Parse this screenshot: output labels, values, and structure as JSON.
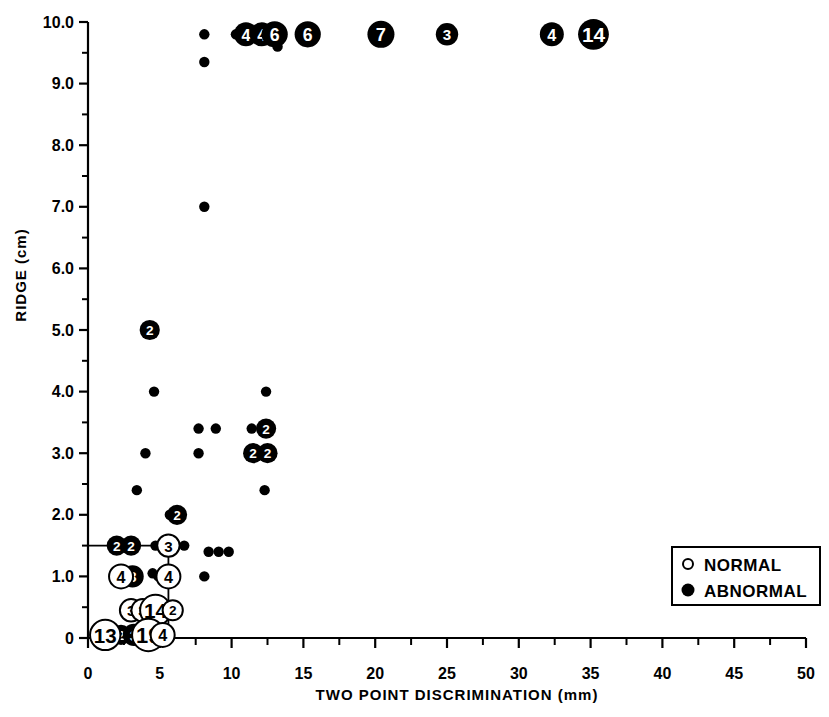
{
  "chart_data": {
    "type": "scatter",
    "title": "",
    "xlabel": "TWO POINT DISCRIMINATION  (mm)",
    "ylabel": "RIDGE (cm)",
    "xlim": [
      0,
      50
    ],
    "ylim": [
      0,
      10
    ],
    "xticks": [
      0,
      5,
      10,
      15,
      20,
      25,
      30,
      35,
      40,
      45,
      50
    ],
    "xtick_labels": [
      "0",
      "5",
      "10",
      "15",
      "20",
      "25",
      "30",
      "35",
      "40",
      "45",
      "50"
    ],
    "xtick_minor_step": 2.5,
    "yticks": [
      0,
      1,
      2,
      3,
      4,
      5,
      6,
      7,
      8,
      9,
      10
    ],
    "ytick_labels": [
      "0",
      "1.0",
      "2.0",
      "3.0",
      "4.0",
      "5.0",
      "6.0",
      "7.0",
      "8.0",
      "9.0",
      "10.0"
    ],
    "ytick_minor_step": 0.5,
    "grid": false,
    "legend_position": "bottom-right",
    "legend": [
      {
        "key": "normal",
        "label": "NORMAL",
        "marker": "open-circle"
      },
      {
        "key": "abnormal",
        "label": "ABNORMAL",
        "marker": "filled-circle"
      }
    ],
    "series": [
      {
        "name": "ABNORMAL",
        "marker": "filled-circle",
        "points": [
          {
            "x": 8.1,
            "y": 9.8,
            "n": 1
          },
          {
            "x": 8.1,
            "y": 9.35,
            "n": 1
          },
          {
            "x": 10.3,
            "y": 9.8,
            "n": 1
          },
          {
            "x": 11.0,
            "y": 9.8,
            "n": 4
          },
          {
            "x": 12.1,
            "y": 9.8,
            "n": 4
          },
          {
            "x": 13.0,
            "y": 9.8,
            "n": 6
          },
          {
            "x": 13.2,
            "y": 9.6,
            "n": 1
          },
          {
            "x": 15.3,
            "y": 9.8,
            "n": 6
          },
          {
            "x": 20.4,
            "y": 9.8,
            "n": 7
          },
          {
            "x": 25.0,
            "y": 9.8,
            "n": 3
          },
          {
            "x": 32.3,
            "y": 9.8,
            "n": 4
          },
          {
            "x": 35.2,
            "y": 9.8,
            "n": 14
          },
          {
            "x": 8.1,
            "y": 7.0,
            "n": 1
          },
          {
            "x": 4.3,
            "y": 5.0,
            "n": 2
          },
          {
            "x": 4.6,
            "y": 4.0,
            "n": 1
          },
          {
            "x": 12.4,
            "y": 4.0,
            "n": 1
          },
          {
            "x": 7.7,
            "y": 3.4,
            "n": 1
          },
          {
            "x": 8.9,
            "y": 3.4,
            "n": 1
          },
          {
            "x": 11.4,
            "y": 3.4,
            "n": 1
          },
          {
            "x": 12.4,
            "y": 3.4,
            "n": 2
          },
          {
            "x": 4.0,
            "y": 3.0,
            "n": 1
          },
          {
            "x": 7.7,
            "y": 3.0,
            "n": 1
          },
          {
            "x": 11.5,
            "y": 3.0,
            "n": 2
          },
          {
            "x": 12.5,
            "y": 3.0,
            "n": 2
          },
          {
            "x": 3.4,
            "y": 2.4,
            "n": 1
          },
          {
            "x": 12.3,
            "y": 2.4,
            "n": 1
          },
          {
            "x": 6.2,
            "y": 2.0,
            "n": 2
          },
          {
            "x": 5.7,
            "y": 2.0,
            "n": 1
          },
          {
            "x": 2.0,
            "y": 1.5,
            "n": 2
          },
          {
            "x": 3.0,
            "y": 1.5,
            "n": 2
          },
          {
            "x": 4.7,
            "y": 1.5,
            "n": 1
          },
          {
            "x": 6.7,
            "y": 1.5,
            "n": 1
          },
          {
            "x": 8.4,
            "y": 1.4,
            "n": 1
          },
          {
            "x": 9.1,
            "y": 1.4,
            "n": 1
          },
          {
            "x": 9.8,
            "y": 1.4,
            "n": 1
          },
          {
            "x": 3.1,
            "y": 1.0,
            "n": 3
          },
          {
            "x": 4.5,
            "y": 1.05,
            "n": 1
          },
          {
            "x": 4.9,
            "y": 1.0,
            "n": 1
          },
          {
            "x": 8.1,
            "y": 1.0,
            "n": 1
          },
          {
            "x": 2.3,
            "y": 0.05,
            "n": 2
          },
          {
            "x": 3.2,
            "y": 0.05,
            "n": 3
          }
        ]
      },
      {
        "name": "NORMAL",
        "marker": "open-circle",
        "points": [
          {
            "x": 5.6,
            "y": 1.5,
            "n": 3
          },
          {
            "x": 2.3,
            "y": 1.0,
            "n": 4
          },
          {
            "x": 5.6,
            "y": 1.0,
            "n": 4
          },
          {
            "x": 3.0,
            "y": 0.45,
            "n": 3
          },
          {
            "x": 3.8,
            "y": 0.45,
            "n": 3
          },
          {
            "x": 4.7,
            "y": 0.45,
            "n": 14
          },
          {
            "x": 5.9,
            "y": 0.45,
            "n": 2
          },
          {
            "x": 1.2,
            "y": 0.05,
            "n": 13
          },
          {
            "x": 4.2,
            "y": 0.05,
            "n": 19
          },
          {
            "x": 5.2,
            "y": 0.05,
            "n": 4
          }
        ]
      }
    ],
    "connector_lines": [
      {
        "from": [
          0.0,
          1.5
        ],
        "to": [
          5.6,
          1.5
        ]
      },
      {
        "from": [
          5.6,
          1.5
        ],
        "to": [
          5.6,
          0.05
        ]
      }
    ]
  },
  "legend_box": {
    "items": [
      {
        "marker": "open-circle",
        "label": "NORMAL"
      },
      {
        "marker": "filled-circle",
        "label": "ABNORMAL"
      }
    ]
  },
  "colors": {
    "foreground": "#000000",
    "background": "#ffffff",
    "marker_fill_abnormal": "#000000",
    "marker_fill_normal": "#ffffff",
    "marker_stroke": "#000000"
  }
}
